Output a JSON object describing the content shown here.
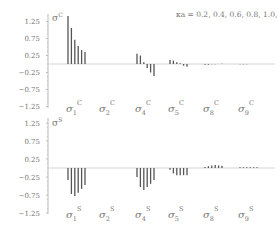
{
  "chart_data": [
    {
      "type": "bar",
      "title": "σ^C",
      "annotation": "κa = 0.2, 0.4, 0.6, 0.8, 1.0, 1.2",
      "legend_series": [
        "κa=0.2",
        "κa=0.4",
        "κa=0.6",
        "κa=0.8",
        "κa=1.0",
        "κa=1.2"
      ],
      "categories": [
        "σ1^C",
        "σ2^C",
        "σ4^C",
        "σ5^C",
        "σ8^C",
        "σ9^C"
      ],
      "series": [
        {
          "name": "σ1^C",
          "values": [
            1.41,
            1.06,
            0.71,
            0.53,
            0.41,
            0.35
          ]
        },
        {
          "name": "σ2^C",
          "values": [
            0,
            0,
            0,
            0,
            0,
            0
          ]
        },
        {
          "name": "σ4^C",
          "values": [
            0.3,
            0.25,
            0.05,
            -0.12,
            -0.25,
            -0.35
          ]
        },
        {
          "name": "σ5^C",
          "values": [
            0.12,
            0.1,
            0.05,
            0.02,
            -0.05,
            -0.08
          ]
        },
        {
          "name": "σ8^C",
          "values": [
            -0.02,
            -0.02,
            -0.01,
            -0.01,
            0.0,
            0.01
          ]
        },
        {
          "name": "σ9^C",
          "values": [
            -0.01,
            -0.01,
            -0.01,
            0.0,
            0.0,
            0.0
          ]
        }
      ],
      "yticks": [
        "1.25",
        "0.75",
        "0.25",
        "−0.25",
        "−0.75",
        "−1.25"
      ],
      "ylim": [
        -1.25,
        1.25
      ],
      "grid": false
    },
    {
      "type": "bar",
      "title": "σ^S",
      "categories": [
        "σ1^S",
        "σ2^S",
        "σ4^S",
        "σ5^S",
        "σ8^S",
        "σ9^S"
      ],
      "series": [
        {
          "name": "σ1^S",
          "values": [
            -0.33,
            -0.72,
            -0.78,
            -0.69,
            -0.58,
            -0.47
          ]
        },
        {
          "name": "σ2^S",
          "values": [
            0,
            0,
            0,
            0,
            0,
            0
          ]
        },
        {
          "name": "σ4^S",
          "values": [
            -0.25,
            -0.53,
            -0.61,
            -0.53,
            -0.44,
            -0.33
          ]
        },
        {
          "name": "σ5^S",
          "values": [
            -0.05,
            -0.15,
            -0.2,
            -0.2,
            -0.2,
            -0.2
          ]
        },
        {
          "name": "σ8^S",
          "values": [
            0.03,
            0.05,
            0.07,
            0.08,
            0.07,
            0.06
          ]
        },
        {
          "name": "σ9^S",
          "values": [
            0.02,
            0.02,
            0.02,
            0.02,
            0.02,
            0.02
          ]
        }
      ],
      "yticks": [
        "1.25",
        "0.75",
        "0.25",
        "−0.25",
        "−0.75",
        "−1.25"
      ],
      "ylim": [
        -1.25,
        1.25
      ],
      "grid": false
    }
  ],
  "top": {
    "ylabel": "σ",
    "ylabel_sup": "C",
    "annotation": "κa = 0.2, 0.4, 0.6, 0.8, 1.0, 1.2",
    "cat_labels": [
      {
        "base": "σ",
        "sub": "1",
        "sup": "C"
      },
      {
        "base": "σ",
        "sub": "2",
        "sup": "C"
      },
      {
        "base": "σ",
        "sub": "4",
        "sup": "C"
      },
      {
        "base": "σ",
        "sub": "5",
        "sup": "C"
      },
      {
        "base": "σ",
        "sub": "8",
        "sup": "C"
      },
      {
        "base": "σ",
        "sub": "9",
        "sup": "C"
      }
    ]
  },
  "bottom": {
    "ylabel": "σ",
    "ylabel_sup": "S",
    "cat_labels": [
      {
        "base": "σ",
        "sub": "1",
        "sup": "S"
      },
      {
        "base": "σ",
        "sub": "2",
        "sup": "S"
      },
      {
        "base": "σ",
        "sub": "4",
        "sup": "S"
      },
      {
        "base": "σ",
        "sub": "5",
        "sup": "S"
      },
      {
        "base": "σ",
        "sub": "8",
        "sup": "S"
      },
      {
        "base": "σ",
        "sub": "9",
        "sup": "S"
      }
    ]
  },
  "colors": {
    "bar": "#555555",
    "axis": "#aaaaaa",
    "text": "#777777"
  }
}
